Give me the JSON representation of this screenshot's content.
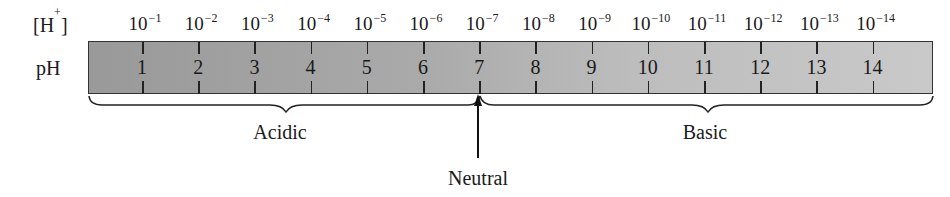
{
  "row_labels": {
    "h_conc": "[H+]",
    "h_base": "[H",
    "h_sup": "+",
    "h_close": "]",
    "ph": "pH"
  },
  "scale": {
    "ph_values": [
      "1",
      "2",
      "3",
      "4",
      "5",
      "6",
      "7",
      "8",
      "9",
      "10",
      "11",
      "12",
      "13",
      "14"
    ],
    "h_exponents": [
      "−1",
      "−2",
      "−3",
      "−4",
      "−5",
      "−6",
      "−7",
      "−8",
      "−9",
      "−10",
      "−11",
      "−12",
      "−13",
      "−14"
    ],
    "h_base": "10"
  },
  "regions": {
    "acidic": "Acidic",
    "basic": "Basic",
    "neutral": "Neutral"
  },
  "colors": {
    "bar_dark": "#999999",
    "bar_light": "#c9c9c9",
    "ink": "#1a1a1a"
  }
}
